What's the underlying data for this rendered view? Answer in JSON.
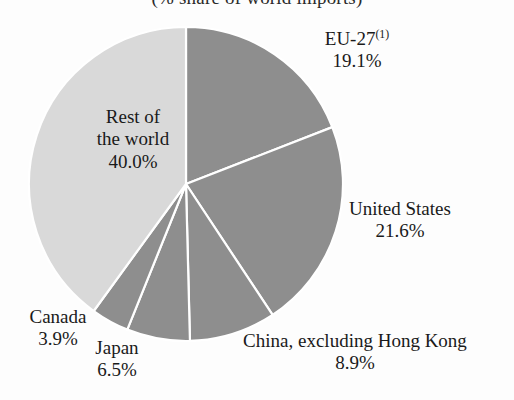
{
  "chart_data": {
    "type": "pie",
    "title": "(% share of world imports)",
    "unit": "%",
    "categories": [
      "EU-27",
      "United States",
      "China, excluding Hong Kong",
      "Japan",
      "Canada",
      "Rest of the world"
    ],
    "values": [
      19.1,
      21.6,
      8.9,
      6.5,
      3.9,
      40.0
    ],
    "labels": [
      "19.1%",
      "21.6%",
      "8.9%",
      "6.5%",
      "3.9%",
      "40.0%"
    ],
    "colors": [
      "#8e8e8e",
      "#8e8e8e",
      "#8e8e8e",
      "#8e8e8e",
      "#8e8e8e",
      "#d9d9d9"
    ],
    "slice_border_color": "#ffffff",
    "start_angle_deg": -90,
    "direction": "clockwise",
    "legend": "none",
    "grid": false,
    "xlabel": "",
    "ylabel": "",
    "footnote_marker": "(1)",
    "slices": [
      {
        "name": "EU-27",
        "value": 19.1,
        "value_label": "19.1%",
        "superscript": "(1)",
        "color": "#8e8e8e",
        "label_position": "outside-right-top"
      },
      {
        "name": "United States",
        "value": 21.6,
        "value_label": "21.6%",
        "superscript": "",
        "color": "#8e8e8e",
        "label_position": "outside-right"
      },
      {
        "name": "China, excluding Hong Kong",
        "value": 8.9,
        "value_label": "8.9%",
        "superscript": "",
        "color": "#8e8e8e",
        "label_position": "outside-bottom-right"
      },
      {
        "name": "Japan",
        "value": 6.5,
        "value_label": "6.5%",
        "superscript": "",
        "color": "#8e8e8e",
        "label_position": "outside-bottom"
      },
      {
        "name": "Canada",
        "value": 3.9,
        "value_label": "3.9%",
        "superscript": "",
        "color": "#8e8e8e",
        "label_position": "outside-bottom-left"
      },
      {
        "name": "Rest of the world",
        "value": 40.0,
        "value_label": "40.0%",
        "superscript": "",
        "color": "#d9d9d9",
        "label_position": "inside"
      }
    ]
  },
  "title": "(% share of world imports)",
  "labels": {
    "eu27": {
      "name_line1": "EU-27",
      "superscript": "(1)",
      "value": "19.1%"
    },
    "united_states": {
      "name": "United States",
      "value": "21.6%"
    },
    "china": {
      "name": "China, excluding Hong Kong",
      "value": "8.9%"
    },
    "japan": {
      "name": "Japan",
      "value": "6.5%"
    },
    "canada": {
      "name": "Canada",
      "value": "3.9%"
    },
    "rest_of_world": {
      "name_line1": "Rest of",
      "name_line2": "the world",
      "value": "40.0%"
    }
  }
}
